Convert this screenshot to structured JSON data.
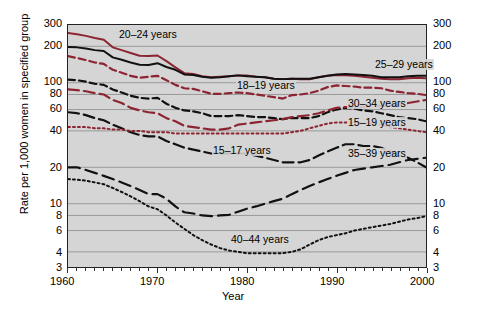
{
  "chart_data": {
    "type": "line",
    "title": "",
    "xlabel": "Year",
    "ylabel": "Rate per 1,000 women in specified group",
    "yscale": "log",
    "ylim": [
      3,
      300
    ],
    "xlim": [
      1960,
      2000
    ],
    "grid": true,
    "legend_position": "inline-annotations",
    "y_ticks": [
      300,
      200,
      100,
      80,
      60,
      40,
      20,
      10,
      8,
      6,
      4,
      3
    ],
    "y_tick_labels": [
      "300",
      "200",
      "100",
      "80",
      "60",
      "40",
      "20",
      "10",
      "8",
      "6",
      "4",
      "3"
    ],
    "x_ticks": [
      1960,
      1970,
      1980,
      1990,
      2000
    ],
    "x_tick_labels": [
      "1960",
      "1970",
      "1980",
      "1990",
      "2000"
    ],
    "x_minor_tick_interval": 1,
    "colors": {
      "maroon": "#8c2432",
      "black": "#111111",
      "plot_bg": "#d5d5d5",
      "grid": "#8a8a8a",
      "frame": "#222222"
    },
    "x": [
      1960,
      1961,
      1962,
      1963,
      1964,
      1965,
      1966,
      1967,
      1968,
      1969,
      1970,
      1971,
      1972,
      1973,
      1974,
      1975,
      1976,
      1977,
      1978,
      1979,
      1980,
      1981,
      1982,
      1983,
      1984,
      1985,
      1986,
      1987,
      1988,
      1989,
      1990,
      1991,
      1992,
      1993,
      1994,
      1995,
      1996,
      1997,
      1998,
      1999,
      2000
    ],
    "series": [
      {
        "name": "20–24 years",
        "label": "20–24 years",
        "color": "#8c2432",
        "style": "solid",
        "values": [
          258,
          252,
          244,
          234,
          227,
          196,
          186,
          176,
          167,
          166,
          168,
          151,
          134,
          120,
          118,
          113,
          111,
          112,
          113,
          115,
          115,
          112,
          111,
          108,
          107,
          108,
          107,
          107,
          111,
          114,
          116,
          115,
          114,
          112,
          110,
          108,
          107,
          107,
          109,
          110,
          109
        ]
      },
      {
        "name": "25–29 years",
        "label": "25–29 years",
        "color": "#111111",
        "style": "solid",
        "values": [
          197,
          196,
          192,
          186,
          183,
          162,
          155,
          147,
          141,
          140,
          145,
          135,
          128,
          117,
          116,
          112,
          110,
          111,
          113,
          115,
          113,
          112,
          111,
          108,
          107,
          108,
          108,
          108,
          111,
          114,
          117,
          118,
          117,
          116,
          114,
          111,
          111,
          111,
          113,
          114,
          114
        ]
      },
      {
        "name": "18–19 years",
        "label": "18–19 years",
        "color": "#8c2432",
        "style": "dashed",
        "values": [
          166,
          160,
          154,
          147,
          143,
          128,
          121,
          114,
          110,
          112,
          114,
          105,
          96,
          90,
          89,
          85,
          81,
          81,
          82,
          83,
          82,
          80,
          78,
          76,
          74,
          79,
          80,
          82,
          86,
          92,
          95,
          94,
          93,
          91,
          91,
          90,
          86,
          84,
          82,
          81,
          79
        ]
      },
      {
        "name": "15–19 years",
        "label": "15–19 years",
        "color": "#111111",
        "style": "dashed",
        "values": [
          106,
          105,
          102,
          98,
          96,
          88,
          83,
          78,
          75,
          74,
          75,
          67,
          62,
          59,
          58,
          56,
          53,
          53,
          53,
          54,
          53,
          52,
          52,
          51,
          50,
          51,
          51,
          51,
          53,
          57,
          60,
          62,
          61,
          59,
          58,
          56,
          54,
          52,
          51,
          50,
          48
        ]
      },
      {
        "name": "30–34 years",
        "label": "30–34 years",
        "color": "#8c2432",
        "style": "dash-long",
        "values": [
          88,
          87,
          85,
          82,
          80,
          72,
          68,
          62,
          59,
          57,
          56,
          51,
          48,
          44,
          43,
          42,
          41,
          41,
          42,
          45,
          46,
          47,
          48,
          49,
          50,
          52,
          53,
          54,
          56,
          59,
          62,
          63,
          63,
          63,
          64,
          64,
          65,
          66,
          68,
          70,
          72
        ]
      },
      {
        "name": "15–17 years",
        "label": "15–17 years",
        "color": "#111111",
        "style": "dash-long",
        "values": [
          57,
          56,
          54,
          51,
          49,
          45,
          42,
          39,
          37,
          36,
          36,
          33,
          31,
          29,
          28,
          27,
          26,
          26,
          26,
          26,
          26,
          25,
          24,
          23,
          22,
          22,
          22,
          23,
          25,
          27,
          29,
          31,
          31,
          30,
          30,
          29,
          27,
          25,
          24,
          22,
          20
        ]
      },
      {
        "name": "35–39 years",
        "label": "35–39 years",
        "color": "#111111",
        "style": "dash-long2",
        "values": [
          20,
          20,
          19,
          18,
          17,
          16,
          15,
          14,
          13,
          12,
          12,
          11,
          9.5,
          8.5,
          8.3,
          8.0,
          7.9,
          8.0,
          8.1,
          8.6,
          9.1,
          9.5,
          10,
          10.5,
          11,
          12,
          13,
          14,
          15,
          16,
          17,
          18,
          19,
          19.5,
          20,
          20.5,
          21,
          22,
          23,
          23.5,
          24
        ]
      },
      {
        "name": "15–19 years dotted",
        "label": "",
        "color": "#8c2432",
        "style": "dotted",
        "values": [
          43,
          43,
          43,
          42,
          42,
          41,
          41,
          40,
          40,
          39,
          39,
          39,
          38,
          38,
          38,
          38,
          38,
          38,
          38,
          38,
          38,
          38,
          38,
          38,
          38,
          39,
          40,
          42,
          44,
          46,
          47,
          47,
          47,
          46,
          46,
          45,
          43,
          42,
          41,
          40,
          39
        ]
      },
      {
        "name": "40–44 years",
        "label": "40–44 years",
        "color": "#111111",
        "style": "dotted",
        "values": [
          16,
          15.8,
          15.5,
          15.0,
          14.5,
          13.5,
          12.5,
          11.5,
          10.5,
          9.5,
          9.0,
          8.0,
          7.0,
          6.2,
          5.5,
          5.0,
          4.6,
          4.3,
          4.1,
          4.0,
          3.9,
          3.9,
          3.9,
          3.9,
          3.9,
          4.0,
          4.2,
          4.6,
          5.0,
          5.3,
          5.5,
          5.7,
          6.0,
          6.2,
          6.4,
          6.6,
          6.8,
          7.1,
          7.4,
          7.6,
          7.9
        ]
      }
    ],
    "annotations": [
      {
        "text": "20–24 years",
        "x_px": 118,
        "y_px": 29
      },
      {
        "text": "25–29 years",
        "x_px": 374,
        "y_px": 59
      },
      {
        "text": "18–19 years",
        "x_px": 236,
        "y_px": 80
      },
      {
        "text": "30–34 years",
        "x_px": 347,
        "y_px": 98
      },
      {
        "text": "15–19 years",
        "x_px": 347,
        "y_px": 117
      },
      {
        "text": "15–17 years",
        "x_px": 212,
        "y_px": 145
      },
      {
        "text": "35–39 years",
        "x_px": 347,
        "y_px": 148
      },
      {
        "text": "40–44 years",
        "x_px": 230,
        "y_px": 234
      }
    ]
  },
  "axis": {
    "ylabel": "Rate per 1,000 women in specified group",
    "xlabel": "Year"
  }
}
